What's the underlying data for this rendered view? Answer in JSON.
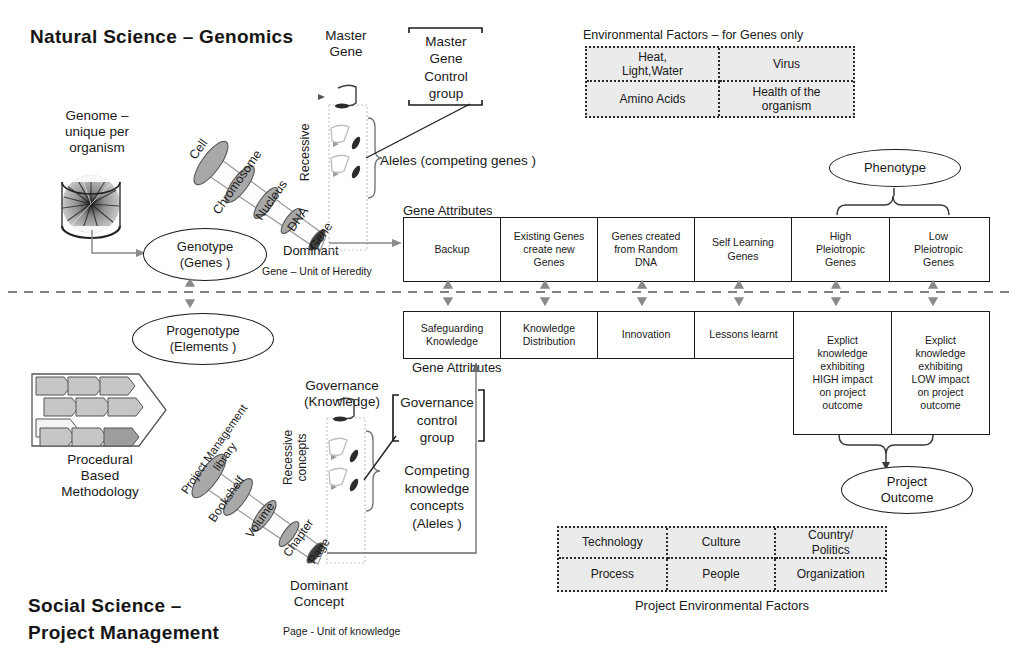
{
  "titles": {
    "top": "Natural Science  –  Genomics",
    "bottom_line1": "Social Science   –",
    "bottom_line2": "Project Management"
  },
  "top_section": {
    "genome_label": "Genome –\nunique per\norganism",
    "genome_icon": "genome-circos-icon",
    "genotype_ellipse": "Genotype\n(Genes )",
    "cone_segments": [
      "Cell",
      "Chromosome",
      "Nucleus",
      "DNA",
      "Gene"
    ],
    "recessive_label": "Recessive",
    "dominant_label": "Dominant",
    "master_gene_label": "Master\nGene",
    "master_gene_control_group": "Master\nGene\nControl\ngroup",
    "aleles_label": "Aleles  (competing genes )",
    "gene_attributes_label": "Gene Attributes",
    "unit_note": "Gene – Unit of Heredity",
    "phenotype_ellipse": "Phenotype"
  },
  "bottom_section": {
    "progenotype_ellipse": "Progenotype\n(Elements )",
    "methodology_label": "Procedural\nBased\nMethodology",
    "methodology_icon": "chevron-process-icon",
    "cone_segments": [
      "Project Management\nlibrary",
      "Bookshelf",
      "Volume",
      "Chapter",
      "Page"
    ],
    "recessive_label": "Recessive\nconcepts",
    "dominant_label": "Dominant\nConcept",
    "governance_label": "Governance\n(Knowledge)",
    "governance_control_group": "Governance\ncontrol\ngroup",
    "competing_label": "Competing\nknowledge\nconcepts\n(Aleles )",
    "gene_attributes_label": "Gene Attributes",
    "unit_note": "Page - Unit of knowledge",
    "project_outcome_ellipse": "Project\nOutcome"
  },
  "gene_attributes_top": {
    "header": "Gene Attributes",
    "cells": [
      "Backup",
      "Existing Genes\ncreate new\nGenes",
      "Genes created\nfrom Random\nDNA",
      "Self Learning\nGenes",
      "High\nPleiotropic\nGenes",
      "Low\nPleiotropic\nGenes"
    ]
  },
  "gene_attributes_bottom": {
    "header": "Gene Attributes",
    "cells": [
      "Safeguarding\nKnowledge",
      "Knowledge\nDistribution",
      "Innovation",
      "Lessons learnt",
      "Explict\nknowledge\nexhibiting\nHIGH impact\non project\noutcome",
      "Explict\nknowledge\nexhibiting\nLOW impact\non project\noutcome"
    ]
  },
  "environmental_factors_genes": {
    "caption": "Environmental Factors   –  for Genes only",
    "rows": [
      [
        "Heat,\nLight,Water",
        "Virus"
      ],
      [
        "Amino Acids",
        "Health of the\norganism"
      ]
    ]
  },
  "project_environmental_factors": {
    "caption": "Project Environmental Factors",
    "rows": [
      [
        "Technology",
        "Culture",
        "Country/\nPolitics"
      ],
      [
        "Process",
        "People",
        "Organization"
      ]
    ]
  },
  "colors": {
    "ink": "#1a1a1a",
    "table_fill": "#ebebeb",
    "cone_fill": "#a8a8a8",
    "arrow_gray": "#8a8a8a"
  }
}
